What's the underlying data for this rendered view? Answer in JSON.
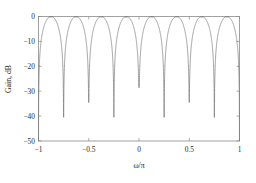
{
  "chart_data": {
    "type": "line",
    "title": "",
    "subtitle": "",
    "xlabel": "ω/π",
    "ylabel": "Gain, dB",
    "xlim": [
      -1,
      1
    ],
    "ylim": [
      -50,
      0
    ],
    "grid": false,
    "legend": null,
    "xticks": [
      -1,
      -0.5,
      0,
      0.5,
      1
    ],
    "xticklabels": [
      "−1",
      "−0.5",
      "0",
      "0.5",
      "1"
    ],
    "yticks": [
      0,
      -10,
      -20,
      -30,
      -40,
      -50
    ],
    "yticklabels": [
      "0",
      "−10",
      "−20",
      "−30",
      "−40",
      "−50"
    ],
    "series": [
      {
        "name": "Gain",
        "color": "#777777",
        "notch_frequencies": [
          -1,
          -0.75,
          -0.5,
          -0.25,
          0,
          0.25,
          0.5,
          0.75,
          1
        ],
        "notch_depths_db": [
          -50,
          -40.5,
          -34.5,
          -40.5,
          -28.5,
          -40.5,
          -34.5,
          -40.5,
          -50
        ],
        "passband_peaks_x": [
          -0.875,
          -0.625,
          -0.375,
          -0.125,
          0.125,
          0.375,
          0.625,
          0.875
        ],
        "passband_peaks_db": [
          -0.3,
          -0.2,
          -0.2,
          -0.25,
          -0.25,
          -0.2,
          -0.2,
          -0.3
        ]
      }
    ]
  },
  "axes": {
    "y_label": "Gain, dB",
    "x_label": "ω/π"
  }
}
